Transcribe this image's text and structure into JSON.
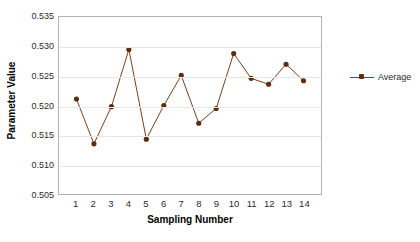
{
  "chart_data": {
    "type": "line",
    "title": "",
    "xlabel": "Sampling Number",
    "ylabel": "Parameter Value",
    "categories": [
      1,
      2,
      3,
      4,
      5,
      6,
      7,
      8,
      9,
      10,
      11,
      12,
      13,
      14
    ],
    "x_tick_labels": [
      "1",
      "2",
      "3",
      "4",
      "5",
      "6",
      "7",
      "8",
      "9",
      "10",
      "11",
      "12",
      "13",
      "14"
    ],
    "y_tick_labels": [
      "0.505",
      "0.510",
      "0.515",
      "0.520",
      "0.525",
      "0.530",
      "0.535"
    ],
    "y_ticks": [
      0.505,
      0.51,
      0.515,
      0.52,
      0.525,
      0.53,
      0.535
    ],
    "ylim": [
      0.505,
      0.535
    ],
    "xlim": [
      0.5,
      14.5
    ],
    "grid": true,
    "grid_axis": "y",
    "legend_position": "right",
    "series": [
      {
        "name": "Average",
        "color": "#7b3f1d",
        "marker_color": "#5c2e11",
        "marker": "circle",
        "values": [
          0.5211,
          0.5135,
          0.5198,
          0.5295,
          0.5143,
          0.52,
          0.5251,
          0.517,
          0.5195,
          0.5288,
          0.5246,
          0.5236,
          0.527,
          0.5242
        ]
      }
    ]
  },
  "legend": {
    "entries": [
      {
        "label": "Average"
      }
    ]
  },
  "colors": {
    "series_line": "#7b3f1d",
    "series_marker": "#5c2e11",
    "plot_border": "#b3b3b3",
    "gridline": "#e6e6ec",
    "text": "#2b2b2b",
    "background": "#ffffff"
  }
}
